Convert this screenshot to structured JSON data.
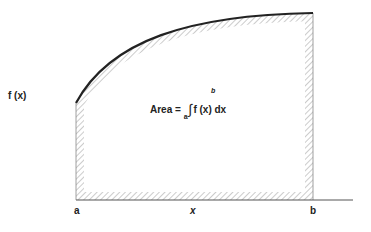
{
  "diagram": {
    "type": "area-under-curve",
    "y_label": "f (x)",
    "x_label": "x",
    "lower_bound_label": "a",
    "upper_bound_label": "b",
    "formula": {
      "prefix": "Area = ",
      "lower_limit": "a",
      "upper_limit": "b",
      "integrand": "f (x) dx"
    },
    "colors": {
      "curve": "#222222",
      "hatch": "#999999",
      "axis": "#555555"
    }
  }
}
